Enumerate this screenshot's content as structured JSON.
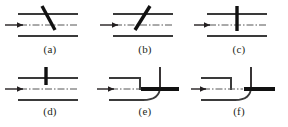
{
  "figure": {
    "kind": "line-diagram",
    "background_color": "#ffffff",
    "line_color": "#231f20",
    "wall_color": "#3a3a3a",
    "centerline_color": "#555555",
    "caption_color": "#231f20",
    "panel_count": 6
  },
  "panels": [
    {
      "id": "a",
      "caption": "(a)",
      "obstacle": "inclined-plate-down-right",
      "obstacle_angle_deg": 60,
      "has_top_wall": true,
      "has_bottom_wall": true,
      "has_centerline": true,
      "has_flow_arrow": true
    },
    {
      "id": "b",
      "caption": "(b)",
      "obstacle": "inclined-plate-up-right",
      "obstacle_angle_deg": -60,
      "has_top_wall": true,
      "has_bottom_wall": true,
      "has_centerline": true,
      "has_flow_arrow": true
    },
    {
      "id": "c",
      "caption": "(c)",
      "obstacle": "vertical-plate-full",
      "obstacle_angle_deg": 90,
      "has_top_wall": true,
      "has_bottom_wall": true,
      "has_centerline": true,
      "has_flow_arrow": true
    },
    {
      "id": "d",
      "caption": "(d)",
      "obstacle": "vertical-plate-upper-half",
      "obstacle_angle_deg": 90,
      "has_top_wall": true,
      "has_bottom_wall": true,
      "has_centerline": true,
      "has_flow_arrow": true
    },
    {
      "id": "e",
      "caption": "(e)",
      "obstacle": "curved-bend-with-horizontal-splitter",
      "has_top_wall": true,
      "has_bottom_wall": true,
      "has_centerline": true,
      "has_flow_arrow": true,
      "has_vertical_branch": true,
      "has_thick_splitter_plate": true
    },
    {
      "id": "f",
      "caption": "(f)",
      "obstacle": "curved-bend-with-short-splitter",
      "has_top_wall": true,
      "has_bottom_wall": true,
      "has_centerline": true,
      "has_flow_arrow": true,
      "has_vertical_branch": true,
      "has_thick_splitter_plate": true
    }
  ]
}
